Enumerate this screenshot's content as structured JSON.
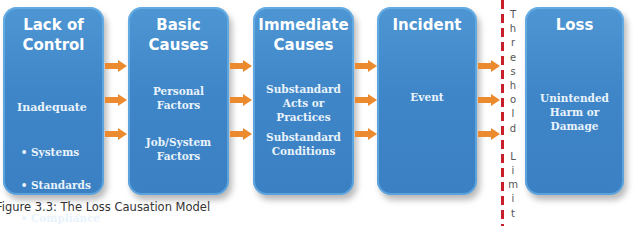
{
  "diagram": {
    "caption": "Figure 3.3:  The Loss Causation Model",
    "colors": {
      "box_fill": "#3f86c8",
      "arrow": "#ec8a2f",
      "threshold_line": "#c8202a",
      "text": "#ffffff"
    },
    "stages": [
      {
        "title": "Lack of\nControl",
        "heading": "Inadequate",
        "bullets": [
          "Systems",
          "Standards",
          "Compliance"
        ]
      },
      {
        "title": "Basic\nCauses",
        "items": [
          "Personal\nFactors",
          "Job/System\nFactors"
        ]
      },
      {
        "title": "Immediate\nCauses",
        "items": [
          "Substandard\nActs or\nPractices",
          "Substandard\nConditions"
        ]
      },
      {
        "title": "Incident",
        "items": [
          "Event"
        ]
      },
      {
        "title": "Loss",
        "items": [
          "Unintended\nHarm or\nDamage"
        ]
      }
    ],
    "threshold": {
      "label": "Threshold Limit",
      "letters": [
        "T",
        "h",
        "r",
        "e",
        "s",
        "h",
        "o",
        "l",
        "d",
        "",
        "L",
        "i",
        "m",
        "i",
        "t"
      ]
    },
    "arrow_icon": "right-arrow-icon"
  }
}
